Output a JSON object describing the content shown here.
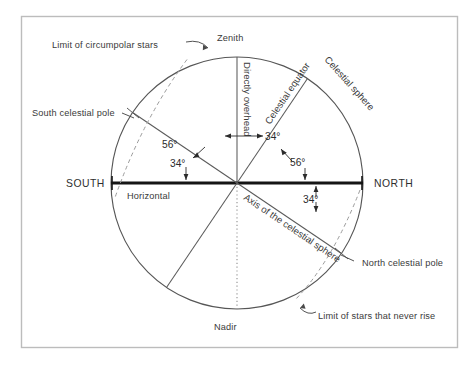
{
  "figure": {
    "border_color": "#b9b9b9",
    "line_color": "#555555",
    "horizon_color": "#1a1a1a",
    "text_color": "#3a3a3a",
    "background": "#ffffff"
  },
  "labels": {
    "zenith": "Zenith",
    "nadir": "Nadir",
    "north": "NORTH",
    "south": "SOUTH",
    "horizontal": "Horizontal",
    "directly_overhead": "Directly overhead",
    "celestial_equator": "Celestial equator",
    "celestial_sphere": "Celestial sphere",
    "axis_of_celestial_sphere": "Axis of the celestial sphere",
    "north_celestial_pole": "North celestial pole",
    "south_celestial_pole": "South celestial pole",
    "limit_circumpolar": "Limit of circumpolar stars",
    "limit_never_rise": "Limit of stars that never rise"
  },
  "angles": {
    "zenith_to_equator": "34°",
    "equator_to_horizon_south": "34°",
    "equator_to_zenith_left": "56°",
    "axis_to_horizon_north": "34°",
    "axis_to_zenith": "56°",
    "axis_below_horizon": "34°"
  },
  "geometry": {
    "center_x": 237,
    "center_y": 183,
    "radius": 126,
    "latitude_degrees": 34,
    "colatitude_degrees": 56
  }
}
